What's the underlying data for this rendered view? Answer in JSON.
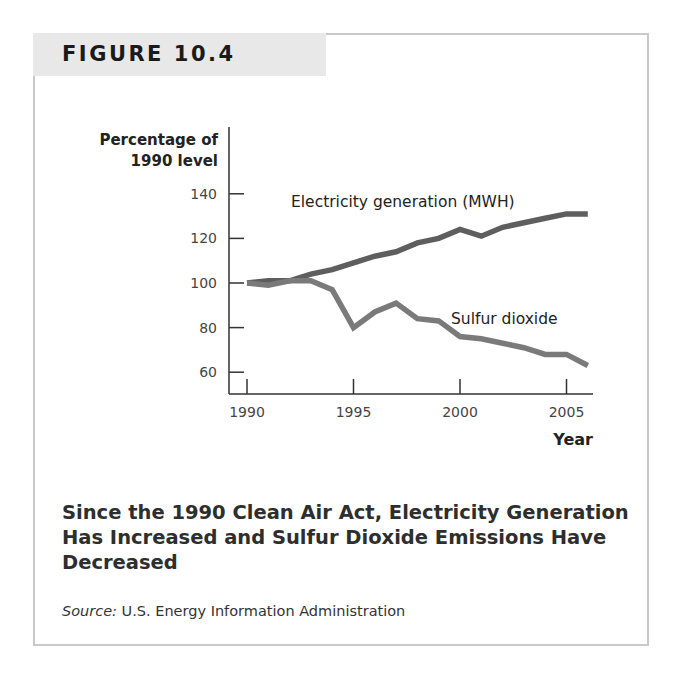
{
  "figure": {
    "label": "FIGURE 10.4",
    "caption": "Since the 1990 Clean Air Act, Electricity Generation Has Increased and Sulfur Dioxide Emissions Have Decreased",
    "source_label": "Source:",
    "source_text": " U.S. Energy Information Administration"
  },
  "chart_data": {
    "type": "line",
    "title": "",
    "xlabel": "Year",
    "ylabel": "Percentage of 1990 level",
    "ylabel_lines": [
      "Percentage of",
      "1990 level"
    ],
    "x": [
      1990,
      1991,
      1992,
      1993,
      1994,
      1995,
      1996,
      1997,
      1998,
      1999,
      2000,
      2001,
      2002,
      2003,
      2004,
      2005,
      2006
    ],
    "x_ticks": [
      "1990",
      "1995",
      "2000",
      "2005"
    ],
    "y_ticks": [
      "60",
      "80",
      "100",
      "120",
      "140"
    ],
    "ylim": [
      55,
      145
    ],
    "xlim": [
      1990,
      2006
    ],
    "grid": false,
    "legend": "inline labels",
    "series": [
      {
        "name": "Electricity generation (MWH)",
        "values": [
          100,
          101,
          101,
          104,
          106,
          109,
          112,
          114,
          118,
          120,
          124,
          121,
          125,
          127,
          129,
          131,
          131
        ],
        "color": "#5e5e5e"
      },
      {
        "name": "Sulfur dioxide",
        "values": [
          100,
          99,
          101,
          101,
          97,
          80,
          87,
          91,
          84,
          83,
          76,
          75,
          73,
          71,
          68,
          68,
          63
        ],
        "color": "#7a7a7a"
      }
    ]
  }
}
